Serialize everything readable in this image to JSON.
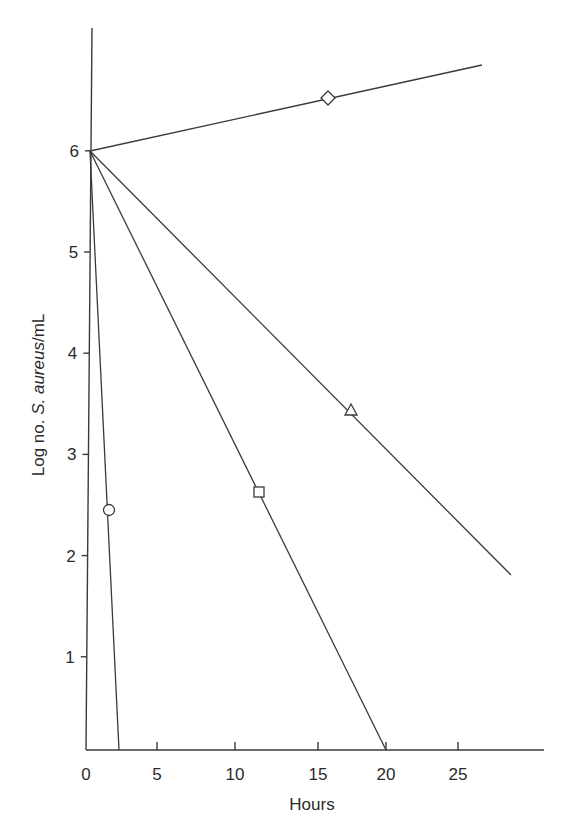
{
  "chart_data": {
    "type": "line",
    "title": "",
    "xlabel": "Hours",
    "ylabel_parts": [
      "Log no. ",
      "S. aureus",
      "/mL"
    ],
    "ylabel": "Log no. S. aureus/mL",
    "xlim": [
      0,
      30
    ],
    "ylim": [
      0,
      7
    ],
    "x_ticks": [
      0,
      5,
      10,
      15,
      20,
      25
    ],
    "y_ticks": [
      1,
      2,
      3,
      4,
      5,
      6
    ],
    "grid": false,
    "legend": "none",
    "series": [
      {
        "name": "diamond",
        "marker": "diamond",
        "x": [
          0,
          16,
          26.5
        ],
        "y": [
          6,
          6.5,
          6.8
        ],
        "marker_point": [
          16,
          6.5
        ]
      },
      {
        "name": "triangle",
        "marker": "triangle",
        "x": [
          0,
          17.5,
          28.5
        ],
        "y": [
          6,
          3.4,
          1.8
        ],
        "marker_point": [
          17.5,
          3.4
        ]
      },
      {
        "name": "square",
        "marker": "square",
        "x": [
          0,
          11.5,
          20.2
        ],
        "y": [
          6,
          2.6,
          0
        ],
        "marker_point": [
          11.5,
          2.6
        ]
      },
      {
        "name": "circle",
        "marker": "circle",
        "x": [
          0,
          1.6,
          2.3
        ],
        "y": [
          6,
          2.45,
          0
        ],
        "marker_point": [
          1.6,
          2.45
        ]
      }
    ]
  }
}
